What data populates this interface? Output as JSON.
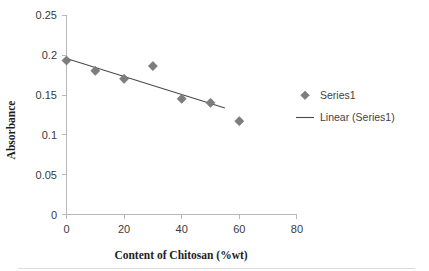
{
  "chart_data": {
    "type": "scatter",
    "title": "",
    "xlabel": "Content of Chitosan (%wt)",
    "ylabel": "Absorbance",
    "xlim": [
      0,
      80
    ],
    "ylim": [
      0,
      0.25
    ],
    "xticks": [
      "0",
      "20",
      "40",
      "60",
      "80"
    ],
    "xtick_values": [
      0,
      20,
      40,
      60,
      80
    ],
    "yticks": [
      "0",
      "0.05",
      "0.1",
      "0.15",
      "0.2",
      "0.25"
    ],
    "ytick_values": [
      0,
      0.05,
      0.1,
      0.15,
      0.2,
      0.25
    ],
    "grid": false,
    "legend_position": "right",
    "series": [
      {
        "name": "Series1",
        "kind": "scatter",
        "marker": "diamond",
        "color": "#7d7d7d",
        "x": [
          0,
          10,
          20,
          30,
          40,
          50,
          60
        ],
        "y": [
          0.193,
          0.18,
          0.17,
          0.186,
          0.145,
          0.14,
          0.117
        ]
      },
      {
        "name": "Linear (Series1)",
        "kind": "line",
        "color": "#4a4a4a",
        "x": [
          0,
          55
        ],
        "y": [
          0.1955,
          0.1335
        ],
        "slope": -0.001127,
        "intercept": 0.1955
      }
    ],
    "legend": [
      {
        "label": "Series1",
        "symbol": "diamond",
        "color": "#7d7d7d"
      },
      {
        "label": "Linear (Series1)",
        "symbol": "line",
        "color": "#4a4a4a"
      }
    ]
  },
  "axis": {
    "y_title": "Absorbance",
    "x_title": "Content of Chitosan (%wt)",
    "y_labels": {
      "t0": "0.25",
      "t1": "0.2",
      "t2": "0.15",
      "t3": "0.1",
      "t4": "0.05",
      "t5": "0"
    },
    "x_labels": {
      "t0": "0",
      "t1": "20",
      "t2": "40",
      "t3": "60",
      "t4": "80"
    }
  },
  "legend": {
    "series_label": "Series1",
    "trend_label": "Linear (Series1)"
  },
  "colors": {
    "marker": "#7d7d7d",
    "trendline": "#4a4a4a",
    "axis": "#b8b8b8",
    "text": "#3a3a3a",
    "background": "#ffffff"
  }
}
